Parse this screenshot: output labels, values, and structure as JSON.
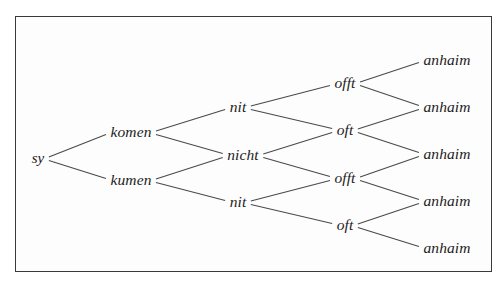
{
  "figure": {
    "kind": "derivation-tree-diagram",
    "border_color": "#3a3a3a",
    "background_color": "#ffffff",
    "line_color": "#4a4a4a",
    "text_color": "#1c1c1c"
  },
  "chart_data": {
    "type": "diagram",
    "title": "",
    "layout": "left-to-right binary branching lattice",
    "levels": 5,
    "nodes": {
      "root": {
        "id": "n0",
        "label": "sy",
        "x": 38,
        "y": 158
      },
      "level2": [
        {
          "id": "n1",
          "label": "komen",
          "x": 131,
          "y": 132
        },
        {
          "id": "n2",
          "label": "kumen",
          "x": 131,
          "y": 180
        }
      ],
      "level3": [
        {
          "id": "n3",
          "label": "nit",
          "x": 238,
          "y": 107
        },
        {
          "id": "n4",
          "label": "nicht",
          "x": 243,
          "y": 155
        },
        {
          "id": "n5",
          "label": "nit",
          "x": 238,
          "y": 202
        }
      ],
      "level4": [
        {
          "id": "n6",
          "label": "offt",
          "x": 345,
          "y": 83
        },
        {
          "id": "n7",
          "label": "oft",
          "x": 345,
          "y": 130
        },
        {
          "id": "n8",
          "label": "offt",
          "x": 345,
          "y": 178
        },
        {
          "id": "n9",
          "label": "oft",
          "x": 345,
          "y": 225
        }
      ],
      "level5": [
        {
          "id": "n10",
          "label": "anhaim",
          "x": 447,
          "y": 60
        },
        {
          "id": "n11",
          "label": "anhaim",
          "x": 447,
          "y": 107
        },
        {
          "id": "n12",
          "label": "anhaim",
          "x": 447,
          "y": 154
        },
        {
          "id": "n13",
          "label": "anhaim",
          "x": 447,
          "y": 201
        },
        {
          "id": "n14",
          "label": "anhaim",
          "x": 447,
          "y": 248
        }
      ]
    },
    "edges": [
      {
        "from": "n0",
        "to": "n1"
      },
      {
        "from": "n0",
        "to": "n2"
      },
      {
        "from": "n1",
        "to": "n3"
      },
      {
        "from": "n1",
        "to": "n4"
      },
      {
        "from": "n2",
        "to": "n4"
      },
      {
        "from": "n2",
        "to": "n5"
      },
      {
        "from": "n3",
        "to": "n6"
      },
      {
        "from": "n3",
        "to": "n7"
      },
      {
        "from": "n4",
        "to": "n7"
      },
      {
        "from": "n4",
        "to": "n8"
      },
      {
        "from": "n5",
        "to": "n8"
      },
      {
        "from": "n5",
        "to": "n9"
      },
      {
        "from": "n6",
        "to": "n10"
      },
      {
        "from": "n6",
        "to": "n11"
      },
      {
        "from": "n7",
        "to": "n11"
      },
      {
        "from": "n7",
        "to": "n12"
      },
      {
        "from": "n8",
        "to": "n12"
      },
      {
        "from": "n8",
        "to": "n13"
      },
      {
        "from": "n9",
        "to": "n13"
      },
      {
        "from": "n9",
        "to": "n14"
      }
    ]
  }
}
